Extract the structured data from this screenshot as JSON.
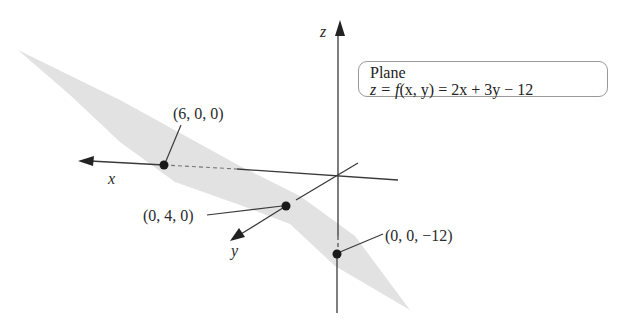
{
  "figure": {
    "axes": {
      "x_label": "x",
      "y_label": "y",
      "z_label": "z"
    },
    "points": [
      {
        "coords": [
          6,
          0,
          0
        ],
        "label": "(6, 0, 0)"
      },
      {
        "coords": [
          0,
          4,
          0
        ],
        "label": "(0, 4, 0)"
      },
      {
        "coords": [
          0,
          0,
          -12
        ],
        "label": "(0, 0, −12)"
      }
    ],
    "legend": {
      "title": "Plane",
      "equation_lhs": "z = ",
      "equation_f": "f",
      "equation_args": "(x, y)",
      "equation_rhs": " = 2x + 3y − 12"
    },
    "colors": {
      "plane_fill": "#e2e2e2",
      "axis_line": "#3a3a3a",
      "point": "#1a1a1a",
      "legend_border": "#9a9a9a"
    }
  }
}
